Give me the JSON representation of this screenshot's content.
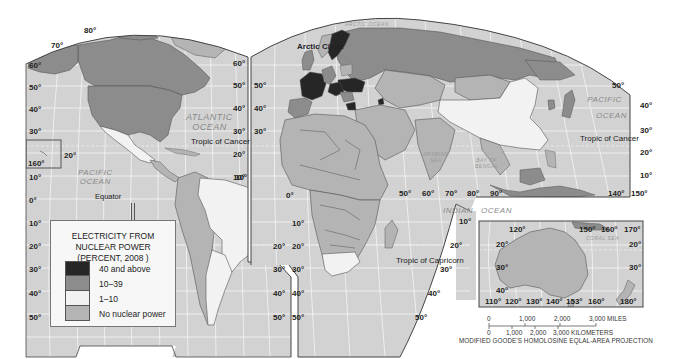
{
  "legend": {
    "title_lines": [
      "ELECTRICITY FROM",
      "NUCLEAR POWER",
      "(PERCENT, 2008 )"
    ],
    "items": [
      {
        "label": "40 and above",
        "color": "#262626"
      },
      {
        "label": "10–39",
        "color": "#8c8c8c"
      },
      {
        "label": "1–10",
        "color": "#f2f2f2"
      },
      {
        "label": "No nuclear power",
        "color": "#b4b4b4"
      }
    ]
  },
  "colors": {
    "ocean": "#d2d2d2",
    "land_none": "#b4b4b4",
    "land_mid": "#8c8c8c",
    "land_high": "#262626",
    "land_low": "#f2f2f2",
    "border": "#555555",
    "grid": "#f5f5f5"
  },
  "oceans": {
    "atlantic": [
      "ATLANTIC",
      "OCEAN"
    ],
    "pacific_west": [
      "PACIFIC",
      "OCEAN"
    ],
    "pacific_east": [
      "PACIFIC",
      "OCEAN"
    ],
    "indian_1": "INDIAN",
    "indian_2": "OCEAN",
    "arctic": "ARCTIC OCEAN",
    "arabian": [
      "ARABIAN",
      "SEA"
    ],
    "bengal": [
      "BAY OF",
      "BENGAL"
    ],
    "coral": "CORAL SEA"
  },
  "lines": {
    "arctic_circle": "Arctic Circle",
    "tropic_cancer_west": "Tropic of Cancer",
    "tropic_cancer_east": "Tropic of Cancer",
    "equator": "Equator",
    "tropic_capricorn": "Tropic of Capricorn"
  },
  "graticule": {
    "west_left": [
      "60°",
      "50°",
      "40°",
      "30°",
      "10°",
      "0°",
      "10°",
      "20°",
      "30°",
      "40°",
      "50°"
    ],
    "west_right": [
      "60°",
      "50°",
      "40°",
      "30°",
      "20°",
      "10°"
    ],
    "top": [
      "80°",
      "70°"
    ],
    "hawaii_20": "20°",
    "hawaii_160": "160°",
    "sa_right": [
      "20°",
      "30°",
      "40°",
      "50°"
    ],
    "east_left": [
      "50°",
      "40°",
      "30°",
      "10°",
      "20°",
      "30°",
      "40°",
      "50°"
    ],
    "east_zero": "0°",
    "east_10n": "10°",
    "indian_lon": [
      "50°",
      "60°",
      "70°",
      "80°",
      "90°"
    ],
    "africa_right": [
      "10°",
      "20°",
      "30°",
      "40°",
      "50°"
    ],
    "pacific_right": [
      "50°",
      "40°",
      "30°",
      "20°",
      "10°"
    ],
    "pacific_lon": [
      "140°",
      "150°"
    ],
    "aus_top": [
      "120°",
      "150°",
      "160°",
      "170°"
    ],
    "aus_left": [
      "20°",
      "30°",
      "40°"
    ],
    "aus_right": [
      "20°",
      "30°"
    ],
    "aus_bottom": [
      "110°",
      "120°",
      "130°",
      "140°",
      "153°",
      "160°",
      "180°"
    ]
  },
  "scale": {
    "miles": [
      "0",
      "1,000",
      "2,000",
      "3,000 MILES"
    ],
    "km": [
      "0",
      "1,000",
      "2,000",
      "3,000 KILOMETERS"
    ]
  },
  "credit": "MODIFIED GOODE'S HOMOLOSINE EQLAL-AREA PROJECTION"
}
